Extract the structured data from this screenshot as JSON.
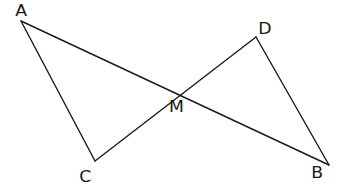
{
  "diagram": {
    "type": "geometry",
    "points": [
      {
        "name": "A",
        "x": 21,
        "y": 21,
        "label_x": 16,
        "label_y": 3
      },
      {
        "name": "D",
        "x": 256,
        "y": 37,
        "label_x": 259,
        "label_y": 22
      },
      {
        "name": "M",
        "x": 172,
        "y": 98,
        "label_x": 171,
        "label_y": 100
      },
      {
        "name": "C",
        "x": 95,
        "y": 161,
        "label_x": 80,
        "label_y": 170
      },
      {
        "name": "B",
        "x": 329,
        "y": 165,
        "label_x": 313,
        "label_y": 165
      }
    ],
    "segments": [
      {
        "from": "A",
        "to": "C"
      },
      {
        "from": "A",
        "to": "B"
      },
      {
        "from": "C",
        "to": "D"
      },
      {
        "from": "D",
        "to": "B"
      }
    ],
    "labels": {
      "A": "A",
      "B": "B",
      "C": "C",
      "D": "D",
      "M": "M"
    },
    "line_color": "#1a1a1a",
    "background": "#ffffff"
  }
}
